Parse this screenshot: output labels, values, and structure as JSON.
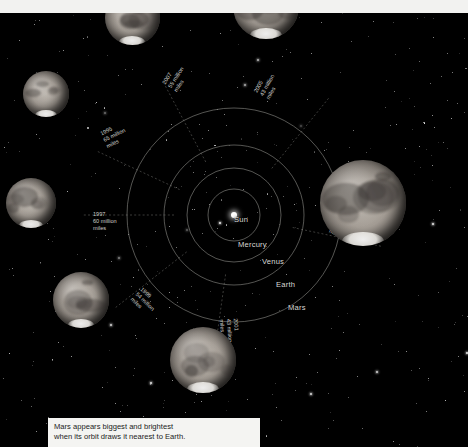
{
  "figure": {
    "type": "orbital-diagram",
    "background_color": "#000000",
    "line_color": "#8f8f8a",
    "label_color": "#d8d8d4",
    "panel_color": "#f2f2f0"
  },
  "caption": {
    "line1": "Mars appears biggest and brightest",
    "line2": "when its orbit draws it nearest to Earth."
  },
  "bodies": [
    {
      "name": "Sun",
      "label": "Sun",
      "x": 234,
      "y": 215,
      "orbit_radius": 0
    },
    {
      "name": "Mercury",
      "label": "Mercury",
      "x": 238,
      "y": 240,
      "orbit_radius": 26
    },
    {
      "name": "Venus",
      "label": "Venus",
      "x": 262,
      "y": 257,
      "orbit_radius": 47
    },
    {
      "name": "Earth",
      "label": "Earth",
      "x": 276,
      "y": 280,
      "orbit_radius": 70
    },
    {
      "name": "Mars",
      "label": "Mars",
      "x": 288,
      "y": 303,
      "orbit_radius": 107
    }
  ],
  "orbits": [
    {
      "body": "Mercury",
      "radius": 26,
      "style": "solid"
    },
    {
      "body": "Venus",
      "radius": 47,
      "style": "solid"
    },
    {
      "body": "Earth",
      "radius": 70,
      "style": "solid"
    },
    {
      "body": "Mars",
      "radius": 107,
      "style": "solid"
    }
  ],
  "chart_data": {
    "type": "scatter",
    "xlabel": "",
    "ylabel": "",
    "categories": [
      "1995",
      "1997",
      "1999",
      "2001",
      "2003",
      "2005",
      "2007"
    ],
    "values": [
      65,
      60,
      54,
      43,
      35,
      43,
      55
    ],
    "unit": "million miles",
    "series": [
      {
        "name": "Distance from Earth at opposition (million miles)",
        "values": [
          65,
          60,
          54,
          43,
          35,
          43,
          55
        ]
      }
    ]
  },
  "oppositions": [
    {
      "year": "1995",
      "distance": "65 million",
      "unit": "miles",
      "angle_deg": 155,
      "label_x": 104,
      "label_y": 130,
      "label_rot": -26,
      "mars": {
        "x": 46,
        "y": 94,
        "size": 46
      }
    },
    {
      "year": "1997",
      "distance": "60 million",
      "unit": "miles",
      "angle_deg": 180,
      "label_x": 93,
      "label_y": 211,
      "label_rot": 0,
      "mars": {
        "x": 31,
        "y": 203,
        "size": 50
      }
    },
    {
      "year": "1999",
      "distance": "54 million",
      "unit": "miles",
      "angle_deg": 218,
      "label_x": 136,
      "label_y": 283,
      "label_rot": 44,
      "mars": {
        "x": 81,
        "y": 300,
        "size": 56
      }
    },
    {
      "year": "2001",
      "distance": "43 million",
      "unit": "miles",
      "angle_deg": 262,
      "label_x": 228,
      "label_y": 308,
      "label_rot": 86,
      "mars": {
        "x": 203,
        "y": 360,
        "size": 66
      }
    },
    {
      "year": "2003",
      "distance": "35 million",
      "unit": "miles",
      "angle_deg": 348,
      "label_x": 332,
      "label_y": 214,
      "label_rot": 24,
      "mars": {
        "x": 363,
        "y": 203,
        "size": 86
      }
    },
    {
      "year": "2005",
      "distance": "43 million",
      "unit": "miles",
      "angle_deg": 51,
      "label_x": 262,
      "label_y": 85,
      "label_rot": -61,
      "mars": {
        "x": 266,
        "y": 6,
        "size": 66
      }
    },
    {
      "year": "2007",
      "distance": "55 million",
      "unit": "miles",
      "angle_deg": 118,
      "label_x": 170,
      "label_y": 77,
      "label_rot": -57,
      "mars": {
        "x": 132,
        "y": 17,
        "size": 55
      }
    }
  ]
}
